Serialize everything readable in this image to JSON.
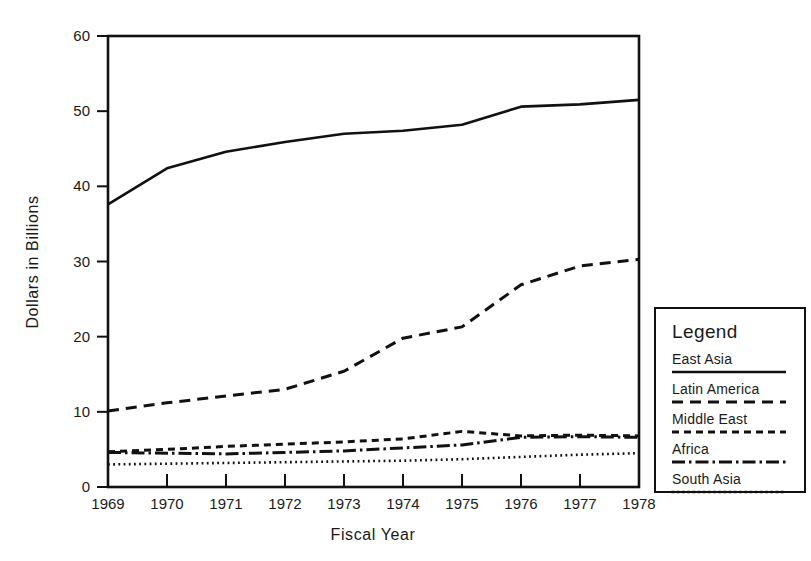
{
  "chart_data": {
    "type": "line",
    "title": "",
    "xlabel": "Fiscal Year",
    "ylabel": "Dollars in Billions",
    "x": [
      1969,
      1970,
      1971,
      1972,
      1973,
      1974,
      1975,
      1976,
      1977,
      1978
    ],
    "categories": [
      "1969",
      "1970",
      "1971",
      "1972",
      "1973",
      "1974",
      "1975",
      "1976",
      "1977",
      "1978"
    ],
    "xlim": [
      1969,
      1978
    ],
    "ylim": [
      0,
      60
    ],
    "yticks": [
      0,
      10,
      20,
      30,
      40,
      50,
      60
    ],
    "ytick_labels": [
      "0",
      "10",
      "20",
      "30",
      "40",
      "50",
      "60"
    ],
    "grid": false,
    "legend_position": "right-outside",
    "legend_title": "Legend",
    "series": [
      {
        "name": "East Asia",
        "style": "solid",
        "values": [
          37.6,
          42.4,
          44.6,
          45.9,
          47.0,
          47.4,
          48.2,
          50.6,
          50.9,
          51.5
        ]
      },
      {
        "name": "Latin America",
        "style": "dashed-long",
        "values": [
          10.1,
          11.2,
          12.1,
          13.0,
          15.4,
          19.8,
          21.3,
          26.9,
          29.4,
          30.3
        ]
      },
      {
        "name": "Middle East",
        "style": "dashed-short",
        "values": [
          4.7,
          5.0,
          5.4,
          5.7,
          6.0,
          6.4,
          7.4,
          6.8,
          6.9,
          6.8
        ]
      },
      {
        "name": "Africa",
        "style": "dash-dot",
        "values": [
          4.6,
          4.5,
          4.4,
          4.6,
          4.8,
          5.2,
          5.6,
          6.6,
          6.7,
          6.6
        ]
      },
      {
        "name": "South Asia",
        "style": "dotted",
        "values": [
          3.0,
          3.1,
          3.2,
          3.3,
          3.4,
          3.5,
          3.7,
          4.0,
          4.3,
          4.5
        ]
      }
    ]
  },
  "legend": {
    "title": "Legend",
    "entries": [
      {
        "label": "East Asia",
        "style": "solid"
      },
      {
        "label": "Latin America",
        "style": "dashed-long"
      },
      {
        "label": "Middle East",
        "style": "dashed-short"
      },
      {
        "label": "Africa",
        "style": "dash-dot"
      },
      {
        "label": "South Asia",
        "style": "dotted"
      }
    ]
  },
  "axes": {
    "x_title": "Fiscal Year",
    "y_title": "Dollars in Billions",
    "x_tick_labels": [
      "1969",
      "1970",
      "1971",
      "1972",
      "1973",
      "1974",
      "1975",
      "1976",
      "1977",
      "1978"
    ],
    "y_tick_labels": [
      "0",
      "10",
      "20",
      "30",
      "40",
      "50",
      "60"
    ]
  },
  "colors": {
    "ink": "#111111",
    "background": "#ffffff"
  }
}
